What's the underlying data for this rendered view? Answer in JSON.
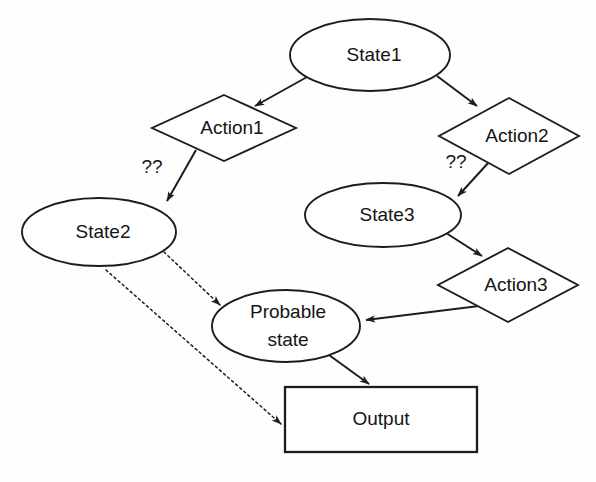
{
  "figure": {
    "background_color": "#fefefe",
    "stroke_color": "#1d1d1d",
    "width": 596,
    "height": 482,
    "caption": ""
  },
  "diagram": {
    "type": "flowchart",
    "title": "",
    "nodes": [
      {
        "id": "state1",
        "label": "State1",
        "shape": "ellipse",
        "cx": 370,
        "cy": 55,
        "rx": 80,
        "ry": 36
      },
      {
        "id": "action1",
        "label": "Action1",
        "shape": "diamond",
        "cx": 224,
        "cy": 128,
        "rx": 72,
        "ry": 33
      },
      {
        "id": "action2",
        "label": "Action2",
        "shape": "diamond",
        "cx": 509,
        "cy": 136,
        "rx": 70,
        "ry": 38
      },
      {
        "id": "state2",
        "label": "State2",
        "shape": "ellipse",
        "cx": 99,
        "cy": 232,
        "rx": 77,
        "ry": 34
      },
      {
        "id": "state3",
        "label": "State3",
        "shape": "ellipse",
        "cx": 383,
        "cy": 215,
        "rx": 78,
        "ry": 32
      },
      {
        "id": "action3",
        "label": "Action3",
        "shape": "diamond",
        "cx": 508,
        "cy": 285,
        "rx": 70,
        "ry": 37
      },
      {
        "id": "probable_state",
        "label": "Probable state",
        "label_line1": "Probable",
        "label_line2": "state",
        "shape": "ellipse",
        "cx": 286,
        "cy": 326,
        "rx": 74,
        "ry": 36
      },
      {
        "id": "output",
        "label": "Output",
        "shape": "rectangle",
        "x": 285,
        "y": 387,
        "width": 192,
        "height": 65
      }
    ],
    "edges": [
      {
        "id": "state1-action1",
        "from": "state1",
        "to": "action1",
        "style": "solid",
        "label": "",
        "x1": 307,
        "y1": 77,
        "x2": 253,
        "y2": 107
      },
      {
        "id": "state1-action2",
        "from": "state1",
        "to": "action2",
        "style": "solid",
        "label": "",
        "x1": 437,
        "y1": 76,
        "x2": 478,
        "y2": 107
      },
      {
        "id": "action1-state2",
        "from": "action1",
        "to": "state2",
        "style": "solid",
        "label": "??",
        "label_x": 152,
        "label_y": 168,
        "x1": 196,
        "y1": 150,
        "x2": 166,
        "y2": 202
      },
      {
        "id": "action2-state3",
        "from": "action2",
        "to": "state3",
        "style": "solid",
        "label": "??",
        "label_x": 456,
        "label_y": 163,
        "x1": 489,
        "y1": 162,
        "x2": 457,
        "y2": 197
      },
      {
        "id": "state3-action3",
        "from": "state3",
        "to": "action3",
        "style": "solid",
        "label": "",
        "x1": 443,
        "y1": 231,
        "x2": 481,
        "y2": 256
      },
      {
        "id": "action3-probable",
        "from": "action3",
        "to": "probable_state",
        "style": "solid",
        "label": "",
        "x1": 479,
        "y1": 306,
        "x2": 364,
        "y2": 320
      },
      {
        "id": "state2-probable",
        "from": "state2",
        "to": "probable_state",
        "style": "dotted",
        "label": "",
        "x1": 164,
        "y1": 252,
        "x2": 219,
        "y2": 306
      },
      {
        "id": "state2-output",
        "from": "state2",
        "to": "output",
        "style": "dotted",
        "label": "",
        "x1": 106,
        "y1": 270,
        "x2": 282,
        "y2": 425
      },
      {
        "id": "probable-output",
        "from": "probable_state",
        "to": "output",
        "style": "solid",
        "label": "",
        "x1": 329,
        "y1": 355,
        "x2": 368,
        "y2": 385
      }
    ]
  }
}
